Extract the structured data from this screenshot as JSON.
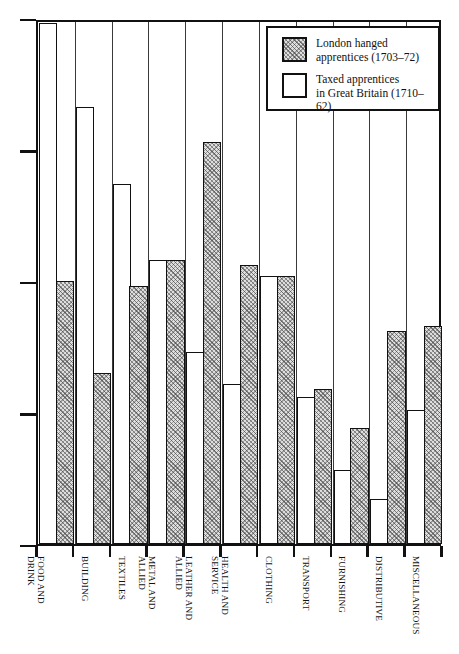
{
  "chart_data": {
    "type": "bar",
    "title": "",
    "xlabel": "",
    "ylabel": "",
    "ylim": [
      0,
      20
    ],
    "yticks": [
      0,
      5,
      10,
      15,
      20
    ],
    "ytick_labels": [
      "0",
      "5",
      "10",
      "15",
      "20"
    ],
    "grid": true,
    "grid_orientation": "vertical",
    "legend_position": "top-right",
    "categories": [
      "FOOD AND\nDRINK",
      "BUILDING",
      "TEXTILES",
      "METAL AND\nALLIED",
      "LEATHER AND\nALLIED",
      "HEALTH AND\nSERVICE",
      "CLOTHING",
      "TRANSPORT",
      "FURNISHING",
      "DISTRIBUTIVE",
      "MISCELLANEOUS"
    ],
    "series": [
      {
        "name": "London hanged apprentices (1703–72)",
        "style": "hatched",
        "values": [
          10.0,
          6.5,
          9.8,
          10.8,
          15.3,
          10.6,
          10.2,
          5.9,
          4.4,
          8.1,
          8.3
        ]
      },
      {
        "name": "Taxed apprentices in Great Britain (1710–62)",
        "style": "open",
        "values": [
          19.8,
          16.6,
          13.7,
          10.8,
          7.3,
          6.1,
          10.2,
          5.6,
          2.8,
          1.7,
          5.1
        ]
      }
    ]
  },
  "legend": {
    "items": [
      {
        "swatch": "hatched",
        "line1": "London hanged",
        "line2": "apprentices (1703–72)"
      },
      {
        "swatch": "open",
        "line1": "Taxed apprentices",
        "line2": "in Great Britain (1710–62)"
      }
    ]
  }
}
